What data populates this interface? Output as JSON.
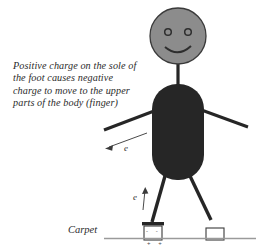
{
  "figure": {
    "title_caption": {
      "lines": [
        "Positive charge on the sole of",
        "the foot causes negative",
        "charge to move to the upper",
        "parts of the body (finger)"
      ]
    },
    "labels": {
      "floor": "Carpet",
      "electron_upper": "e",
      "electron_lower": "e",
      "shoe_negative_signs": "- -",
      "carpet_positive_signs": "+ +"
    },
    "colors": {
      "head_fill": "#8c8c8c",
      "head_stroke": "#3a3a3a",
      "body_fill": "#262626",
      "limb_stroke": "#262626",
      "floor_line": "#9a9a9a",
      "text": "#2b2b2b",
      "shoe_outline": "#3a3a3a",
      "background": "#ffffff"
    },
    "parts": {
      "head": "smiley-face-head",
      "body": "torso",
      "left_arm": "left-arm",
      "right_arm": "right-arm",
      "left_leg": "left-leg",
      "right_leg": "right-leg",
      "left_shoe": "charged-shoe-box",
      "right_shoe": "plain-shoe-box",
      "floor": "carpet-line"
    }
  }
}
